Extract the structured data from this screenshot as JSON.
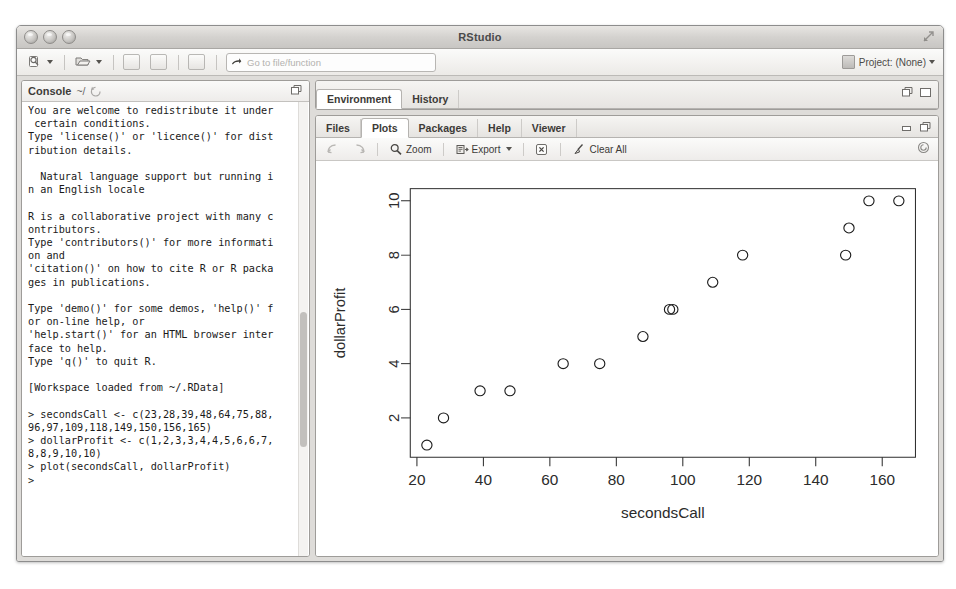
{
  "window": {
    "title": "RStudio",
    "traffic_lights": [
      "close-button",
      "minimize-button",
      "zoom-button"
    ],
    "expand_icon": "expand-icon"
  },
  "toolbar": {
    "new_file_label": "new-file-icon",
    "open_file_label": "open-file-icon",
    "save_label": "save-icon",
    "save_all_label": "save-all-icon",
    "print_label": "print-icon",
    "goto_placeholder": "Go to file/function",
    "project_label": "Project: (None)"
  },
  "console": {
    "title": "Console",
    "path": "~/",
    "refresh_icon": "refresh-icon",
    "maximize_icon": "maximize-icon",
    "text": "You are welcome to redistribute it under\n certain conditions.\nType 'license()' or 'licence()' for dist\nribution details.\n\n  Natural language support but running i\nn an English locale\n\nR is a collaborative project with many c\nontributors.\nType 'contributors()' for more informati\non and\n'citation()' on how to cite R or R packa\nges in publications.\n\nType 'demo()' for some demos, 'help()' f\nor on-line help, or\n'help.start()' for an HTML browser inter\nface to help.\nType 'q()' to quit R.\n\n[Workspace loaded from ~/.RData]\n\n> secondsCall <- c(23,28,39,48,64,75,88,\n96,97,109,118,149,150,156,165)\n> dollarProfit <- c(1,2,3,3,4,4,5,6,6,7,\n8,8,9,10,10)\n> plot(secondsCall, dollarProfit)\n> "
  },
  "environment_pane": {
    "tabs": [
      {
        "label": "Environment",
        "active": true
      },
      {
        "label": "History",
        "active": false
      }
    ],
    "minimize_icon": "minimize-pane-icon",
    "maximize_icon": "maximize-pane-icon"
  },
  "plots_pane": {
    "tabs": [
      {
        "label": "Files",
        "active": false
      },
      {
        "label": "Plots",
        "active": true
      },
      {
        "label": "Packages",
        "active": false
      },
      {
        "label": "Help",
        "active": false
      },
      {
        "label": "Viewer",
        "active": false
      }
    ],
    "minimize_icon": "minimize-pane-icon",
    "maximize_icon": "maximize-pane-icon",
    "toolbar": {
      "back_icon": "back-arrow-icon",
      "forward_icon": "forward-arrow-icon",
      "zoom_label": "Zoom",
      "zoom_icon": "magnifier-icon",
      "export_label": "Export",
      "export_icon": "export-icon",
      "remove_icon": "remove-plot-icon",
      "clear_all_label": "Clear All",
      "clear_all_icon": "broom-icon",
      "refresh_icon": "refresh-plot-icon"
    }
  },
  "chart_data": {
    "type": "scatter",
    "title": "",
    "xlabel": "secondsCall",
    "ylabel": "dollarProfit",
    "xlim": [
      18,
      170
    ],
    "ylim": [
      0.55,
      10.45
    ],
    "xticks": [
      20,
      40,
      60,
      80,
      100,
      120,
      140,
      160
    ],
    "yticks": [
      2,
      4,
      6,
      8,
      10
    ],
    "grid": false,
    "legend": null,
    "marker": "open-circle",
    "x": [
      23,
      28,
      39,
      48,
      64,
      75,
      88,
      96,
      97,
      109,
      118,
      149,
      150,
      156,
      165
    ],
    "y": [
      1,
      2,
      3,
      3,
      4,
      4,
      5,
      6,
      6,
      7,
      8,
      8,
      9,
      10,
      10
    ],
    "points": [
      {
        "x": 23,
        "y": 1
      },
      {
        "x": 28,
        "y": 2
      },
      {
        "x": 39,
        "y": 3
      },
      {
        "x": 48,
        "y": 3
      },
      {
        "x": 64,
        "y": 4
      },
      {
        "x": 75,
        "y": 4
      },
      {
        "x": 88,
        "y": 5
      },
      {
        "x": 96,
        "y": 6
      },
      {
        "x": 97,
        "y": 6
      },
      {
        "x": 109,
        "y": 7
      },
      {
        "x": 118,
        "y": 8
      },
      {
        "x": 149,
        "y": 8
      },
      {
        "x": 150,
        "y": 9
      },
      {
        "x": 156,
        "y": 10
      },
      {
        "x": 165,
        "y": 10
      }
    ]
  }
}
